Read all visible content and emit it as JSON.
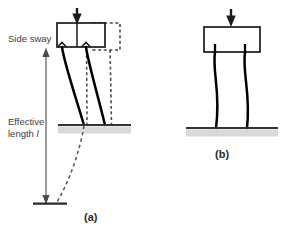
{
  "figure": {
    "title_a": "(a)",
    "title_b": "(b)",
    "annotations": {
      "side_sway": "Side sway",
      "effective_length_line1": "Effective",
      "effective_length_line2": "length",
      "effective_length_symbol": "l"
    },
    "colors": {
      "stroke": "#1a1a1a",
      "ground_line": "#333333",
      "ground_shadow": "#cfcfcf",
      "dimension_line": "#7a7a7a",
      "dashed": "#4d4d4d",
      "text": "#3c3c3c",
      "background": "#ffffff"
    },
    "panel_a": {
      "name": "sway-permitted-frame",
      "beam": {
        "x": 57,
        "y": 23,
        "width": 48,
        "height": 24
      },
      "beam_displaced_dashed": {
        "x": 93,
        "y": 23,
        "width": 27,
        "height": 27
      },
      "load_arrow": {
        "x": 77,
        "y_top": 8,
        "y_bottom": 24
      },
      "beam_center_divider_x": 77,
      "columns": [
        {
          "name": "column-left",
          "top_x": 62,
          "base_x": 84
        },
        {
          "name": "column-right",
          "top_x": 86,
          "base_x": 105
        }
      ],
      "ground_line": {
        "x1": 58,
        "x2": 131,
        "y": 125
      },
      "dimension": {
        "name": "effective-length-dimension",
        "x": 46,
        "y_top": 49,
        "y_bottom": 203,
        "base_tick": {
          "x1": 34,
          "x2": 66,
          "y": 203
        }
      },
      "inflection_dashed_curve": "extends below ground to dimension base"
    },
    "panel_b": {
      "name": "sway-prevented-frame",
      "beam": {
        "x": 204,
        "y": 27,
        "width": 56,
        "height": 25
      },
      "load_arrow": {
        "x": 231,
        "y_top": 9,
        "y_bottom": 27
      },
      "columns": [
        {
          "name": "column-left",
          "top_x": 215,
          "base_x": 216
        },
        {
          "name": "column-right",
          "top_x": 245,
          "base_x": 247
        }
      ],
      "ground_line": {
        "x1": 186,
        "x2": 278,
        "y": 128
      }
    }
  }
}
